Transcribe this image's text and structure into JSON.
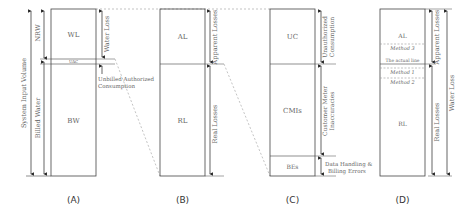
{
  "panels": {
    "A": {
      "caption": "(A)",
      "boxes": {
        "wl": "WL",
        "uac": "UAC",
        "bw": "BW"
      },
      "left_labels": {
        "system_input_volume": "System Input Volume",
        "nrw": "NRW",
        "billed_water": "Billed Water"
      },
      "right_labels": {
        "water_loss": "Water Loss",
        "unbilled_line1": "Unbilled Authorized",
        "unbilled_line2": "Consumption"
      }
    },
    "B": {
      "caption": "(B)",
      "boxes": {
        "al": "AL",
        "rl": "RL"
      },
      "right_labels": {
        "apparent_losses": "Apparent Losses",
        "real_losses": "Real Losses"
      }
    },
    "C": {
      "caption": "(C)",
      "boxes": {
        "uc": "UC",
        "cmis": "CMIs",
        "bes": "BEs"
      },
      "right_labels": {
        "uc_line1": "Unauthorized",
        "uc_line2": "Consumption",
        "cmi_line1": "Customer Meter",
        "cmi_line2": "Inaccuracies",
        "dh_line1": "Data Handling &",
        "dh_line2": "Billing Errors"
      }
    },
    "D": {
      "caption": "(D)",
      "boxes": {
        "al": "AL",
        "rl": "RL"
      },
      "inner_labels": {
        "method3": "Method 3",
        "actual_line": "The actual line",
        "method1": "Method 1",
        "method2": "Method 2"
      },
      "right_labels": {
        "apparent_losses": "Apparent Losses",
        "real_losses": "Real Losses",
        "water_loss": "Water Loss"
      }
    }
  },
  "colors": {
    "line": "#444444",
    "dashed": "#999999",
    "text": "#666666"
  }
}
